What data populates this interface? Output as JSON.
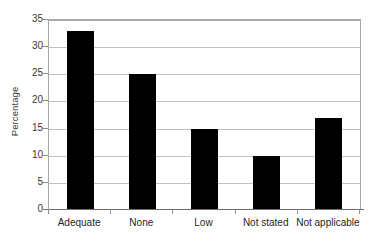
{
  "chart_data": {
    "type": "bar",
    "title": "",
    "subtitle": "",
    "xlabel": "",
    "ylabel": "Percentage",
    "categories": [
      "Adequate",
      "None",
      "Low",
      "Not stated",
      "Not applicable"
    ],
    "values": [
      33,
      25,
      15,
      10,
      17
    ],
    "series": [
      {
        "name": "Percentage",
        "values": [
          33,
          25,
          15,
          10,
          17
        ]
      }
    ],
    "ylim": [
      0,
      35
    ],
    "y_ticks": [
      0,
      5,
      10,
      15,
      20,
      25,
      30,
      35
    ],
    "y_tick_labels": [
      "0",
      "5",
      "10",
      "15",
      "20",
      "25",
      "30",
      "35"
    ],
    "grid": true,
    "grid_orientation": "horizontal",
    "legend": false,
    "legend_position": "none",
    "bar_color": "#000000",
    "grid_color": "#c2c2c2",
    "axis_color": "#8d8d8d",
    "background_color": "#ffffff",
    "annotations": []
  }
}
